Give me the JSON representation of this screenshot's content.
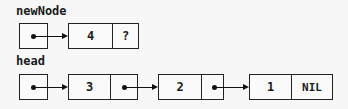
{
  "diagram": {
    "type": "linked-list",
    "newNode": {
      "label": "newNode",
      "node": {
        "value": "4",
        "next": "?"
      }
    },
    "head": {
      "label": "head",
      "nodes": [
        {
          "value": "3",
          "next": "pointer"
        },
        {
          "value": "2",
          "next": "pointer"
        },
        {
          "value": "1",
          "next": "NIL"
        }
      ]
    }
  }
}
